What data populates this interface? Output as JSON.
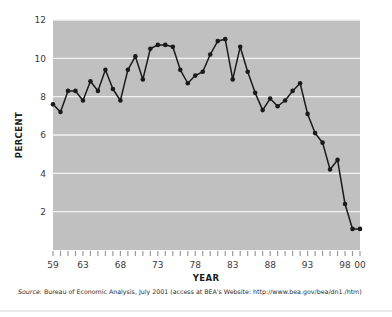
{
  "chart_data": {
    "type": "line",
    "title": "",
    "xlabel": "YEAR",
    "ylabel": "PERCENT",
    "ylim": [
      0,
      12
    ],
    "xlim": [
      1959,
      2000
    ],
    "grid": true,
    "legend": null,
    "ytick_labels": [
      "2",
      "4",
      "6",
      "8",
      "10",
      "12"
    ],
    "ytick_values": [
      2,
      4,
      6,
      8,
      10,
      12
    ],
    "xtick_labels": [
      "59",
      "63",
      "68",
      "73",
      "78",
      "83",
      "88",
      "93",
      "98",
      "00"
    ],
    "xtick_values": [
      1959,
      1963,
      1968,
      1973,
      1978,
      1983,
      1988,
      1993,
      1998,
      2000
    ],
    "x": [
      1959,
      1960,
      1961,
      1962,
      1963,
      1964,
      1965,
      1966,
      1967,
      1968,
      1969,
      1970,
      1971,
      1972,
      1973,
      1974,
      1975,
      1976,
      1977,
      1978,
      1979,
      1980,
      1981,
      1982,
      1983,
      1984,
      1985,
      1986,
      1987,
      1988,
      1989,
      1990,
      1991,
      1992,
      1993,
      1994,
      1995,
      1996,
      1997,
      1998,
      1999,
      2000
    ],
    "values": [
      7.6,
      7.2,
      8.3,
      8.3,
      7.8,
      8.8,
      8.3,
      9.4,
      8.4,
      7.8,
      9.4,
      10.1,
      8.9,
      10.5,
      10.7,
      10.7,
      10.6,
      9.4,
      8.7,
      9.1,
      9.3,
      10.2,
      10.9,
      11.0,
      8.9,
      10.6,
      9.3,
      8.2,
      7.3,
      7.9,
      7.5,
      7.8,
      8.3,
      8.7,
      7.1,
      6.1,
      5.6,
      4.2,
      4.7,
      2.4,
      1.1,
      1.1
    ],
    "series": [
      {
        "name": "Personal saving rate",
        "color": "#1a1a1a",
        "marker": "circle",
        "values": [
          7.6,
          7.2,
          8.3,
          8.3,
          7.8,
          8.8,
          8.3,
          9.4,
          8.4,
          7.8,
          9.4,
          10.1,
          8.9,
          10.5,
          10.7,
          10.7,
          10.6,
          9.4,
          8.7,
          9.1,
          9.3,
          10.2,
          10.9,
          11.0,
          8.9,
          10.6,
          9.3,
          8.2,
          7.3,
          7.9,
          7.5,
          7.8,
          8.3,
          8.7,
          7.1,
          6.1,
          5.6,
          4.2,
          4.7,
          2.4,
          1.1,
          1.1
        ]
      }
    ],
    "plot_bg_color": "#c0c0c0",
    "gridline_color": "#f2f2f2",
    "line_color": "#1a1a1a"
  },
  "source": {
    "prefix": "Source:",
    "text": " Bureau of Economic Analysis, July 2001 (access at BEA's Website: http://www.bea.gov/bea/dn1./htm)"
  }
}
